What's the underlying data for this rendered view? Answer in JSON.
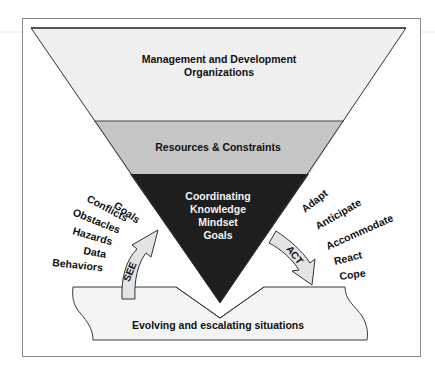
{
  "diagram": {
    "funnel": {
      "top_band": {
        "line1": "Management and Development",
        "line2": "Organizations",
        "fill": "#f0f0f0"
      },
      "middle_band": {
        "label": "Resources & Constraints",
        "fill": "#c6c6c6"
      },
      "bottom_band": {
        "lines": [
          "Coordinating",
          "Knowledge",
          "Mindset",
          "Goals"
        ],
        "fill": "#1e1e1e",
        "text_color": "#ffffff"
      }
    },
    "see_arrow": {
      "label": "SEE",
      "fill": "#e4e4e4"
    },
    "act_arrow": {
      "label": "ACT",
      "fill": "#e4e4e4"
    },
    "see_items": [
      "Goals",
      "Conflicts",
      "Obstacles",
      "Hazards",
      "Data",
      "Behaviors"
    ],
    "act_items": [
      "Adapt",
      "Anticipate",
      "Accommodate",
      "React",
      "Cope"
    ],
    "base": {
      "label": "Evolving and escalating situations",
      "fill": "#f4f4f4"
    },
    "frame_color": "#7a7a7a"
  }
}
